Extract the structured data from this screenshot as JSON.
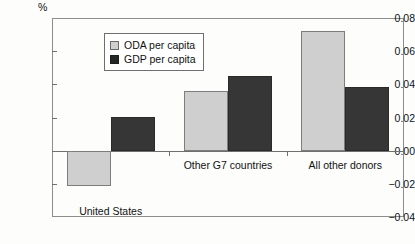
{
  "chart_data": {
    "type": "bar",
    "title": "",
    "subtitle": "",
    "unit_label": "%",
    "xlabel": "",
    "ylabel": "",
    "ylim": [
      -0.04,
      0.08
    ],
    "ytick_labels": [
      "0.08",
      "0.06",
      "0.04",
      "0.02",
      "0.00",
      "-0.02",
      "-0.04"
    ],
    "ytick_values": [
      0.08,
      0.06,
      0.04,
      0.02,
      0.0,
      -0.02,
      -0.04
    ],
    "grid": false,
    "legend_position": "upper-left-inside",
    "categories": [
      "United States",
      "Other G7 countries",
      "All other donors"
    ],
    "series": [
      {
        "name": "ODA per capita",
        "color": "#cfcfcf",
        "values": [
          -0.0215,
          0.036,
          0.072
        ]
      },
      {
        "name": "GDP per capita",
        "color": "#363636",
        "values": [
          0.0205,
          0.045,
          0.0382
        ]
      }
    ]
  },
  "legend": {
    "items": [
      {
        "label": "ODA per capita",
        "swatch": "light-gray-square"
      },
      {
        "label": "GDP per capita",
        "swatch": "dark-square"
      }
    ]
  },
  "axes": {
    "y_unit": "%",
    "y_ticks": [
      {
        "label": "0.08",
        "value": 0.08
      },
      {
        "label": "0.06",
        "value": 0.06
      },
      {
        "label": "0.04",
        "value": 0.04
      },
      {
        "label": "0.02",
        "value": 0.02
      },
      {
        "label": "0.00",
        "value": 0.0
      },
      {
        "label": "-0.02",
        "value": -0.02
      },
      {
        "label": "-0.04",
        "value": -0.04
      }
    ],
    "x_categories": [
      "United States",
      "Other G7 countries",
      "All other donors"
    ]
  }
}
